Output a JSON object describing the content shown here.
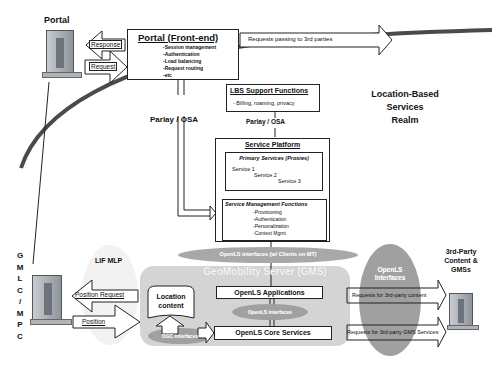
{
  "portal": {
    "title": "Portal",
    "response_label": "Response",
    "request_label": "Request",
    "frontend": {
      "title": "Portal (Front-end)",
      "items": [
        "-Session management",
        "-Authentication",
        "-Load balancing",
        "-Request routing",
        "-etc"
      ]
    },
    "third_party_arrow": "Requests passing to 3rd parties"
  },
  "realm": {
    "line1": "Location-Based",
    "line2": "Services",
    "line3": "Realm"
  },
  "lbs_support": {
    "title": "LBS Support Functions",
    "items": "- Billing, roaming, privacy"
  },
  "parlay_left": "Parlay / OSA",
  "parlay_center": "Parlay / OSA",
  "service_platform": {
    "title": "Service Platform",
    "primary": {
      "title": "Primary Services (Proxies)",
      "services": [
        "Service 1",
        "Service 2",
        "Service 3"
      ]
    },
    "management": {
      "title": "Service Management Functions",
      "items": [
        "-Provisioning",
        "-Authentication",
        "-Personalization",
        "-Context Mgmt"
      ]
    }
  },
  "openls_mt": "OpenLS interfaces (w/ Clients on MT)",
  "gms": {
    "title": "GeoMobility Server (GMS)",
    "location_content_1": "Location",
    "location_content_2": "content",
    "applications": "OpenLS Applications",
    "interfaces": "OpenLS interfaces",
    "core": "OpenLS Core Services",
    "ogc": "OGC interfaces"
  },
  "gmlc": {
    "letters": [
      "G",
      "M",
      "L",
      "C",
      "/",
      "M",
      "P",
      "C"
    ],
    "lif": "LIF MLP",
    "position_request": "Position Request",
    "position": "Position"
  },
  "third_party": {
    "interfaces_1": "OpenLS",
    "interfaces_2": "Interfaces",
    "content_request": "Requests for 3rd-party content",
    "gms_request": "Requests for 3rd-party GMS Services",
    "title_line1": "3rd-Party",
    "title_line2": "Content &",
    "title_line3": "GMSs"
  },
  "colors": {
    "gms_bg": "#d9d9d9",
    "ellipse": "#a8a8a8",
    "curve": "#4a4a4a",
    "server_body": "#9aa0a6"
  }
}
